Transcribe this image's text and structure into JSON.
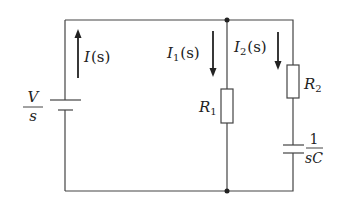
{
  "diagram": {
    "type": "circuit",
    "source": {
      "label_num": "V",
      "label_den": "s"
    },
    "currents": {
      "total": {
        "sym": "I",
        "arg": "(s)"
      },
      "branch1": {
        "sym": "I",
        "sub": "1",
        "arg": "(s)"
      },
      "branch2": {
        "sym": "I",
        "sub": "2",
        "arg": "(s)"
      }
    },
    "resistors": {
      "r1": {
        "sym": "R",
        "sub": "1"
      },
      "r2": {
        "sym": "R",
        "sub": "2"
      }
    },
    "capacitor": {
      "label_num": "1",
      "label_den": "sC"
    },
    "colors": {
      "wire": "#444444",
      "text": "#222222",
      "background": "#ffffff"
    }
  }
}
